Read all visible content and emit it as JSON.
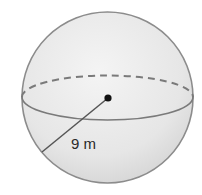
{
  "diagram": {
    "shape": "sphere",
    "radius_label": "9 m",
    "colors": {
      "fill_light": "#f2f2f2",
      "fill_dark": "#d9d9d9",
      "outline": "#8c8c8c",
      "equator": "#7a7a7a",
      "radius_line": "#555555",
      "center_point": "#111111",
      "text": "#2a2a2a"
    }
  }
}
